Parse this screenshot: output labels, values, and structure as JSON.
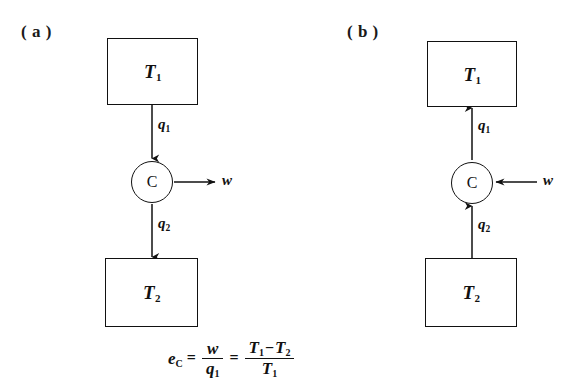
{
  "figure": {
    "background_color": "#ffffff",
    "ink_color": "#111111",
    "panels": [
      {
        "id": "a",
        "label": "( a )",
        "hot_reservoir": {
          "symbol": "T",
          "subscript": "1"
        },
        "engine": {
          "symbol": "C"
        },
        "cold_reservoir": {
          "symbol": "T",
          "subscript": "2"
        },
        "flows": [
          {
            "name": "q1",
            "symbol": "q",
            "subscript": "1",
            "direction": "down"
          },
          {
            "name": "w",
            "symbol": "w",
            "subscript": "",
            "direction": "right"
          },
          {
            "name": "q2",
            "symbol": "q",
            "subscript": "2",
            "direction": "down"
          }
        ]
      },
      {
        "id": "b",
        "label": "( b )",
        "hot_reservoir": {
          "symbol": "T",
          "subscript": "1"
        },
        "engine": {
          "symbol": "C"
        },
        "cold_reservoir": {
          "symbol": "T",
          "subscript": "2"
        },
        "flows": [
          {
            "name": "q1",
            "symbol": "q",
            "subscript": "1",
            "direction": "up"
          },
          {
            "name": "w",
            "symbol": "w",
            "subscript": "",
            "direction": "left"
          },
          {
            "name": "q2",
            "symbol": "q",
            "subscript": "2",
            "direction": "up"
          }
        ]
      }
    ],
    "equation": {
      "lhs": {
        "symbol": "e",
        "subscript": "C"
      },
      "equals_1": "=",
      "fraction_1": {
        "numerator": "w",
        "denominator_symbol": "q",
        "denominator_subscript": "1"
      },
      "equals_2": "=",
      "fraction_2": {
        "numerator_left_symbol": "T",
        "numerator_left_subscript": "1",
        "numerator_operator": "−",
        "numerator_right_symbol": "T",
        "numerator_right_subscript": "2",
        "denominator_symbol": "T",
        "denominator_subscript": "1"
      }
    }
  }
}
